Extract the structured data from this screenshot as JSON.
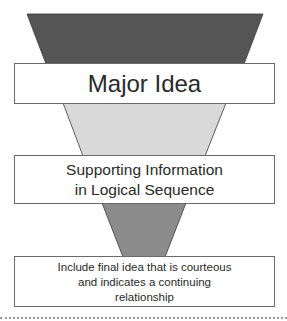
{
  "diagram": {
    "type": "inverted-funnel",
    "colors": {
      "top_wedge": "#555555",
      "middle_wedge": "#d9d9d9",
      "bottom_wedge": "#8c8c8c",
      "box_border": "#6a6a6a",
      "text": "#2a2a2a",
      "dotted_rule": "#9a9a9a"
    },
    "stages": [
      {
        "label_lines": [
          "Major Idea"
        ]
      },
      {
        "label_lines": [
          "Supporting Information",
          "in Logical Sequence"
        ]
      },
      {
        "label_lines": [
          "Include final idea that is courteous",
          "and indicates a continuing",
          "relationship"
        ]
      }
    ]
  }
}
